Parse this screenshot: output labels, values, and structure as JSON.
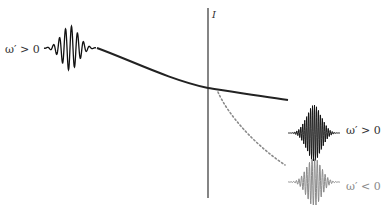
{
  "diagram": {
    "type": "wave-packet-interface-diagram",
    "interface": {
      "label": "I",
      "x": 208,
      "y_top": 8,
      "y_bottom": 198,
      "color": "#333333"
    },
    "incident_packet": {
      "label": "ω′ > 0",
      "center_x": 70,
      "center_y": 48,
      "color": "#111111"
    },
    "incident_path": {
      "style": "solid",
      "color": "#222222",
      "points": [
        [
          97,
          48
        ],
        [
          150,
          70
        ],
        [
          208,
          88
        ]
      ]
    },
    "transmitted_positive": {
      "label": "ω′ > 0",
      "path_style": "solid",
      "path_points": [
        [
          208,
          88
        ],
        [
          260,
          96
        ],
        [
          288,
          100
        ]
      ],
      "packet_center_x": 314,
      "packet_center_y": 133,
      "color": "#111111"
    },
    "transmitted_negative": {
      "label": "ω′ < 0",
      "path_style": "dotted",
      "path_points": [
        [
          218,
          92
        ],
        [
          250,
          130
        ],
        [
          285,
          165
        ]
      ],
      "packet_center_x": 314,
      "packet_center_y": 182,
      "color": "#8a8a8a"
    }
  }
}
